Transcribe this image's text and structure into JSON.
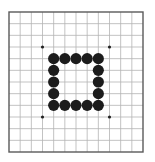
{
  "board": {
    "size": 13,
    "origin_x": 9,
    "origin_y": 12,
    "width": 134,
    "height": 140,
    "background": "#ffffff",
    "grid_color": "#b4b4b4",
    "border_color": "#5a5a5a",
    "star_color": "#222222",
    "star_points": [
      [
        3,
        3
      ],
      [
        9,
        3
      ],
      [
        3,
        9
      ],
      [
        9,
        9
      ]
    ],
    "stones": [
      {
        "x": 4,
        "y": 4,
        "color": "black"
      },
      {
        "x": 5,
        "y": 4,
        "color": "black"
      },
      {
        "x": 6,
        "y": 4,
        "color": "black"
      },
      {
        "x": 7,
        "y": 4,
        "color": "black"
      },
      {
        "x": 8,
        "y": 4,
        "color": "black"
      },
      {
        "x": 4,
        "y": 5,
        "color": "black"
      },
      {
        "x": 8,
        "y": 5,
        "color": "black"
      },
      {
        "x": 4,
        "y": 6,
        "color": "black"
      },
      {
        "x": 8,
        "y": 6,
        "color": "black"
      },
      {
        "x": 4,
        "y": 7,
        "color": "black"
      },
      {
        "x": 8,
        "y": 7,
        "color": "black"
      },
      {
        "x": 4,
        "y": 8,
        "color": "black"
      },
      {
        "x": 5,
        "y": 8,
        "color": "black"
      },
      {
        "x": 6,
        "y": 8,
        "color": "black"
      },
      {
        "x": 7,
        "y": 8,
        "color": "black"
      },
      {
        "x": 8,
        "y": 8,
        "color": "black"
      }
    ],
    "stone_colors": {
      "black": "#1c1c1c",
      "white": "#ffffff"
    }
  }
}
